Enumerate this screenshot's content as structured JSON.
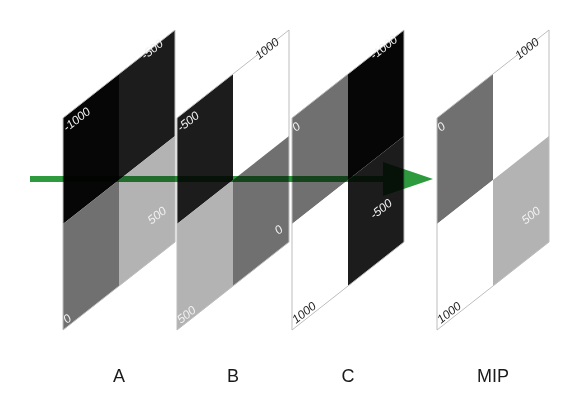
{
  "colors": {
    "arrow": "#2e9a3e",
    "border": "#bdbdbd",
    "values": {
      "-1000": "#060606",
      "-500": "#1c1c1c",
      "0": "#707070",
      "500": "#b3b3b3",
      "1000": "#ffffff"
    }
  },
  "panels": [
    {
      "id": "A",
      "caption": "A",
      "x0": 63,
      "cells": {
        "tl": "-1000",
        "tr": "-500",
        "bl": "0",
        "br": "500"
      }
    },
    {
      "id": "B",
      "caption": "B",
      "x0": 177,
      "cells": {
        "tl": "-500",
        "tr": "1000",
        "bl": "500",
        "br": "0"
      }
    },
    {
      "id": "C",
      "caption": "C",
      "x0": 292,
      "cells": {
        "tl": "0",
        "tr": "-1000",
        "bl": "1000",
        "br": "-500"
      }
    },
    {
      "id": "MIP",
      "caption": "MIP",
      "x0": 437,
      "cells": {
        "tl": "0",
        "tr": "1000",
        "bl": "1000",
        "br": "500"
      }
    }
  ],
  "arrow": {
    "x_start": 30,
    "x_end": 433,
    "y": 179
  }
}
